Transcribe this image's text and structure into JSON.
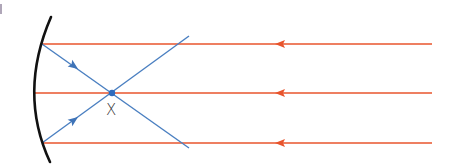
{
  "diagram": {
    "focal_label": "X",
    "colors": {
      "incident_ray": "#e8542c",
      "reflected_ray": "#4a7fc1",
      "mirror": "#111111",
      "focal_point": "#2f6bbd"
    },
    "incident_rays": [
      {
        "y": 44,
        "x_start": 432,
        "x_end": 42,
        "arrow_x": 280
      },
      {
        "y": 93,
        "x_start": 432,
        "x_end": 35,
        "arrow_x": 280
      },
      {
        "y": 143,
        "x_start": 432,
        "x_end": 42,
        "arrow_x": 280
      }
    ],
    "reflected_rays": [
      {
        "x1": 42,
        "y1": 44,
        "x2": 189,
        "y2": 148,
        "arrow_x": 74,
        "arrow_y": 64
      },
      {
        "x1": 42,
        "y1": 143,
        "x2": 189,
        "y2": 36,
        "arrow_x": 74,
        "arrow_y": 120
      }
    ],
    "focal_point": {
      "x": 112,
      "y": 93
    },
    "label_position": {
      "x": 105,
      "y": 101
    }
  }
}
